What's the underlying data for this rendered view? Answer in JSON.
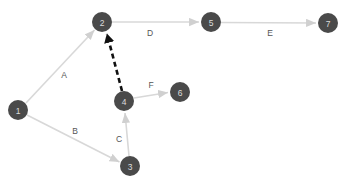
{
  "diagram": {
    "background_color": "#ffffff",
    "node_fill_color": "#4a4a4a",
    "node_text_color": "#dcdcdc",
    "edge_color": "#d8d8d8",
    "highlight_edge_color": "#111111",
    "edge_label_color": "#555555",
    "node_radius": 10,
    "nodes": [
      {
        "id": "1",
        "label": "1",
        "x": 18,
        "y": 110
      },
      {
        "id": "2",
        "label": "2",
        "x": 102,
        "y": 22
      },
      {
        "id": "3",
        "label": "3",
        "x": 130,
        "y": 166
      },
      {
        "id": "4",
        "label": "4",
        "x": 124,
        "y": 101
      },
      {
        "id": "5",
        "label": "5",
        "x": 211,
        "y": 22
      },
      {
        "id": "6",
        "label": "6",
        "x": 180,
        "y": 92
      },
      {
        "id": "7",
        "label": "7",
        "x": 328,
        "y": 23
      }
    ],
    "edges": [
      {
        "id": "A",
        "label": "A",
        "from": "1",
        "to": "2",
        "style": "solid",
        "color": "#d8d8d8",
        "label_x": 64,
        "label_y": 75
      },
      {
        "id": "B",
        "label": "B",
        "from": "1",
        "to": "3",
        "style": "solid",
        "color": "#d8d8d8",
        "label_x": 75,
        "label_y": 131
      },
      {
        "id": "C",
        "label": "C",
        "from": "3",
        "to": "4",
        "style": "solid",
        "color": "#d8d8d8",
        "label_x": 119,
        "label_y": 139
      },
      {
        "id": "D",
        "label": "D",
        "from": "2",
        "to": "5",
        "style": "solid",
        "color": "#d8d8d8",
        "label_x": 150,
        "label_y": 33
      },
      {
        "id": "E",
        "label": "E",
        "from": "5",
        "to": "7",
        "style": "solid",
        "color": "#d8d8d8",
        "label_x": 270,
        "label_y": 33
      },
      {
        "id": "F",
        "label": "F",
        "from": "4",
        "to": "6",
        "style": "solid",
        "color": "#d8d8d8",
        "label_x": 151,
        "label_y": 85
      },
      {
        "id": "H",
        "label": "",
        "from": "4",
        "to": "2",
        "style": "dashed",
        "color": "#111111",
        "label_x": 0,
        "label_y": 0
      }
    ]
  }
}
